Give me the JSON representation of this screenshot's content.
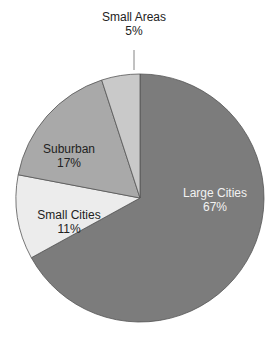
{
  "chart_data": {
    "type": "pie",
    "title": "",
    "start_angle_deg": 90,
    "direction": "clockwise",
    "slices": [
      {
        "label": "Large Cities",
        "value": 67,
        "display": "67%",
        "color": "#7c7c7c",
        "label_color": "#f2f2f2",
        "label_pos": [
          215,
          186
        ]
      },
      {
        "label": "Small Cities",
        "value": 11,
        "display": "11%",
        "color": "#ececec",
        "label_color": "#222222",
        "label_pos": [
          69,
          208
        ]
      },
      {
        "label": "Suburban",
        "value": 17,
        "display": "17%",
        "color": "#a9a9a9",
        "label_color": "#222222",
        "label_pos": [
          69,
          142
        ]
      },
      {
        "label": "Small Areas",
        "value": 5,
        "display": "5%",
        "color": "#c9c9c9",
        "label_color": "#222222",
        "label_pos": [
          134,
          10
        ]
      }
    ],
    "leader_lines": [
      {
        "slice": "Small Areas",
        "x1": 134,
        "y1": 50,
        "x2": 134,
        "y2": 70
      }
    ],
    "legend": null,
    "center": [
      140,
      198
    ],
    "radius": 124
  },
  "labels": {
    "large_cities": {
      "name": "Large Cities",
      "pct": "67%"
    },
    "small_cities": {
      "name": "Small Cities",
      "pct": "11%"
    },
    "suburban": {
      "name": "Suburban",
      "pct": "17%"
    },
    "small_areas": {
      "name": "Small Areas",
      "pct": "5%"
    }
  }
}
